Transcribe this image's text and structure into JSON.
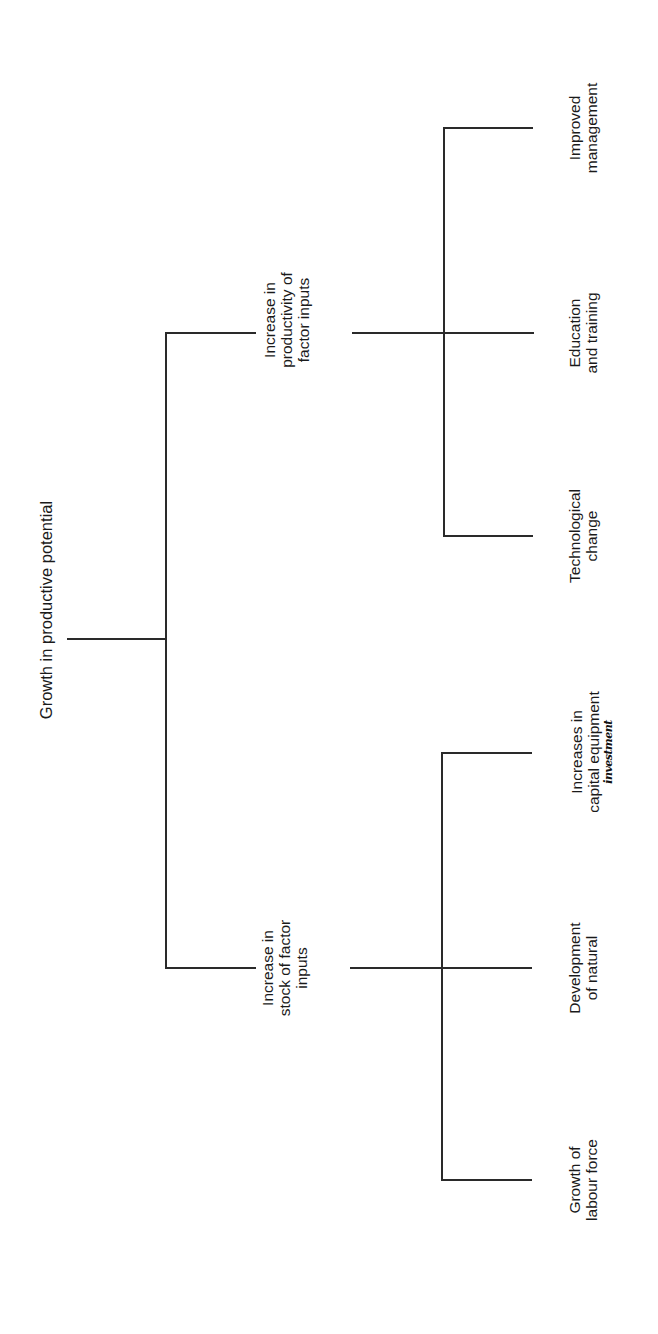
{
  "diagram": {
    "type": "tree",
    "orientation": "rotated-90-ccw",
    "root": {
      "label": "Growth in productive potential"
    },
    "branches": [
      {
        "id": "productivity",
        "lines": [
          "Increase in",
          "productivity of",
          "factor inputs"
        ],
        "children": [
          {
            "id": "improved-management",
            "lines": [
              "Improved",
              "management"
            ]
          },
          {
            "id": "education-training",
            "lines": [
              "Education",
              "and training"
            ]
          },
          {
            "id": "technological-change",
            "lines": [
              "Technological",
              "change"
            ]
          }
        ]
      },
      {
        "id": "stock",
        "lines": [
          "Increase in",
          "stock of factor",
          "inputs"
        ],
        "children": [
          {
            "id": "capital-equipment",
            "lines": [
              "Increases in",
              "capital equipment"
            ],
            "annotation": "investment"
          },
          {
            "id": "natural-resources",
            "lines": [
              "Development",
              "of natural"
            ]
          },
          {
            "id": "labour-force",
            "lines": [
              "Growth of",
              "labour force"
            ]
          }
        ]
      }
    ],
    "line_color": "#2a2a2a"
  }
}
